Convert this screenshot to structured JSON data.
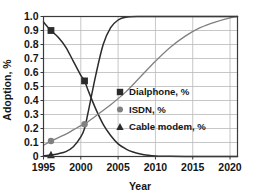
{
  "chart_data": {
    "type": "line",
    "title": "",
    "xlabel": "Year",
    "ylabel": "Adoption, %",
    "xlim": [
      1995,
      2021
    ],
    "ylim": [
      0,
      1.0
    ],
    "grid": true,
    "legend_position": "center-right",
    "xticks": [
      1995,
      2000,
      2005,
      2010,
      2015,
      2020
    ],
    "xtick_labels": [
      "1995",
      "2000",
      "2005",
      "2010",
      "2015",
      "2020"
    ],
    "yticks": [
      0,
      0.1,
      0.2,
      0.3,
      0.4,
      0.5,
      0.6,
      0.7,
      0.8,
      0.9,
      1.0
    ],
    "ytick_labels": [
      "0",
      "0.1",
      "0.2",
      "0.3",
      "0.4",
      "0.5",
      "0.6",
      "0.7",
      "0.8",
      "0.9",
      "1.0"
    ],
    "series": [
      {
        "name": "Dialphone, %",
        "marker": "square",
        "color": "#2b2b2b",
        "x": [
          1995,
          1996,
          1997,
          1998,
          1999,
          2000,
          2000.5,
          2001,
          2002,
          2003,
          2004,
          2005,
          2006,
          2007,
          2008,
          2009,
          2010,
          2012,
          2015,
          2018,
          2021
        ],
        "values": [
          0.96,
          0.9,
          0.85,
          0.78,
          0.68,
          0.58,
          0.54,
          0.47,
          0.34,
          0.23,
          0.15,
          0.09,
          0.055,
          0.032,
          0.018,
          0.009,
          0.004,
          0.001,
          0.0,
          0.0,
          0.0
        ],
        "marker_points": [
          [
            1996,
            0.9
          ],
          [
            2000.5,
            0.54
          ]
        ]
      },
      {
        "name": "ISDN, %",
        "marker": "circle",
        "color": "#808080",
        "x": [
          1995,
          1996,
          1997,
          1998,
          1999,
          2000,
          2000.5,
          2002,
          2004,
          2006,
          2008,
          2010,
          2012,
          2014,
          2016,
          2018,
          2020,
          2021
        ],
        "values": [
          0.08,
          0.11,
          0.135,
          0.16,
          0.19,
          0.22,
          0.23,
          0.29,
          0.37,
          0.46,
          0.57,
          0.68,
          0.78,
          0.86,
          0.92,
          0.96,
          0.99,
          1.0
        ],
        "marker_points": [
          [
            1996,
            0.11
          ],
          [
            2000.5,
            0.23
          ]
        ]
      },
      {
        "name": "Cable modem, %",
        "marker": "triangle",
        "color": "#2b2b2b",
        "x": [
          1995,
          1996,
          1997,
          1998,
          1999,
          2000,
          2000.5,
          2001,
          2002,
          2003,
          2004,
          2005,
          2006,
          2008,
          2010,
          2015,
          2021
        ],
        "values": [
          0.005,
          0.01,
          0.02,
          0.035,
          0.07,
          0.14,
          0.2,
          0.32,
          0.58,
          0.8,
          0.92,
          0.975,
          0.995,
          1.0,
          1.0,
          1.0,
          1.0
        ],
        "marker_points": [
          [
            1996,
            0.01
          ]
        ]
      }
    ],
    "legend": [
      {
        "label": "Dialphone, %",
        "marker": "square",
        "color": "#2b2b2b"
      },
      {
        "label": "ISDN, %",
        "marker": "circle",
        "color": "#808080"
      },
      {
        "label": "Cable modem, %",
        "marker": "triangle",
        "color": "#2b2b2b"
      }
    ]
  }
}
